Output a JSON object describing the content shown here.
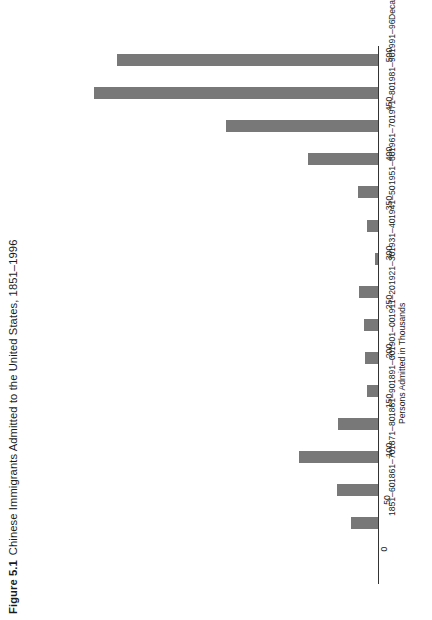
{
  "figure": {
    "label": "Figure 5.1",
    "caption": "Chinese Immigrants Admitted to the United States, 1851–1996"
  },
  "chart_data": {
    "type": "bar",
    "orientation": "horizontal-rotated",
    "title": "Chinese Immigrants Admitted to the United States, 1851–1996",
    "xlabel": "Decade",
    "ylabel": "Persons Admitted in Thousands",
    "ylim": [
      0,
      500
    ],
    "grid": false,
    "legend": null,
    "tick_labels": [
      "0",
      "50",
      "100",
      "150",
      "200",
      "250",
      "300",
      "350",
      "400",
      "450",
      "500"
    ],
    "tick_values": [
      0,
      50,
      100,
      150,
      200,
      250,
      300,
      350,
      400,
      450,
      500
    ],
    "categories": [
      "1991–96",
      "1981–90",
      "1971–80",
      "1961–70",
      "1951–60",
      "1941–50",
      "1931–40",
      "1921–30",
      "1911–20",
      "1901–00",
      "1891–00",
      "1881–90",
      "1871–80",
      "1861–70",
      "1851–60"
    ],
    "values": [
      409,
      446,
      238,
      110,
      32,
      17,
      5,
      30,
      22,
      21,
      17,
      62,
      124,
      65,
      42
    ],
    "units": "thousands of persons"
  },
  "axes": {
    "category_axis_title": "Decade",
    "value_axis_title": "Persons Admitted in Thousands"
  }
}
